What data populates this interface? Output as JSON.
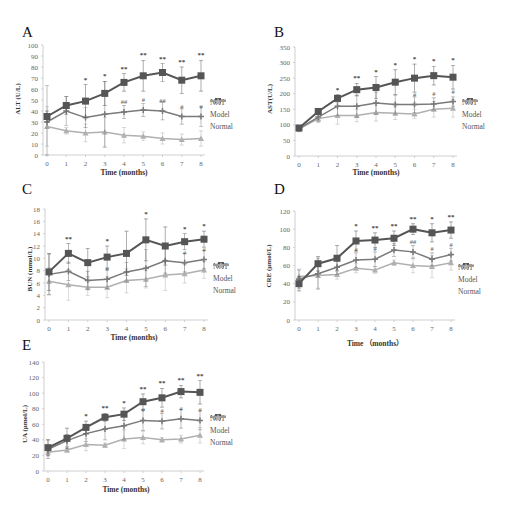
{
  "figure": {
    "legend": [
      "NXT",
      "Model",
      "Normal"
    ],
    "colors": {
      "NXT": "#7a7a7a",
      "Model": "#555555",
      "Normal": "#b0b0b0"
    }
  },
  "chart_data": [
    {
      "panel": "A",
      "type": "line",
      "title": "",
      "xlabel": "Time (months)",
      "ylabel": "ALT (U/L)",
      "x": [
        0,
        1,
        2,
        3,
        4,
        5,
        6,
        7,
        8
      ],
      "ylim": [
        0,
        100
      ],
      "yticks": [
        0,
        10,
        20,
        30,
        40,
        50,
        60,
        70,
        80,
        90,
        100
      ],
      "series": [
        {
          "name": "NXT",
          "values": [
            30,
            40,
            34,
            37,
            39,
            41,
            40,
            35,
            35
          ],
          "errors": [
            33,
            13,
            9,
            30,
            6,
            6,
            8,
            7,
            9
          ]
        },
        {
          "name": "Model",
          "values": [
            35,
            45,
            49,
            56,
            66,
            72,
            75,
            68,
            72
          ],
          "errors": [
            5,
            8,
            15,
            11,
            8,
            14,
            8,
            12,
            14
          ]
        },
        {
          "name": "Normal",
          "values": [
            26,
            22,
            20,
            21,
            18,
            17,
            15,
            14,
            15
          ],
          "errors": [
            18,
            3,
            8,
            13,
            7,
            4,
            5,
            5,
            7
          ]
        }
      ],
      "annotations_model": [
        "",
        "",
        "*",
        "*",
        "**",
        "**",
        "**",
        "**",
        "**"
      ],
      "annotations_nxt": [
        "",
        "",
        "",
        "",
        "##",
        "#",
        "##",
        "#",
        "#"
      ],
      "legend_position": "right"
    },
    {
      "panel": "B",
      "type": "line",
      "title": "",
      "xlabel": "Time (months)",
      "ylabel": "AST(U/L)",
      "x": [
        0,
        1,
        2,
        3,
        4,
        5,
        6,
        7,
        8
      ],
      "ylim": [
        0,
        350
      ],
      "yticks": [
        0,
        50,
        100,
        150,
        200,
        250,
        300,
        350
      ],
      "series": [
        {
          "name": "NXT",
          "values": [
            88,
            125,
            160,
            160,
            170,
            165,
            165,
            167,
            175
          ],
          "errors": [
            8,
            15,
            30,
            35,
            35,
            30,
            25,
            20,
            15
          ]
        },
        {
          "name": "Model",
          "values": [
            90,
            143,
            185,
            213,
            220,
            237,
            250,
            258,
            253
          ],
          "errors": [
            8,
            10,
            12,
            20,
            35,
            40,
            45,
            30,
            38
          ]
        },
        {
          "name": "Normal",
          "values": [
            86,
            120,
            130,
            130,
            140,
            137,
            135,
            150,
            153
          ],
          "errors": [
            8,
            12,
            28,
            20,
            28,
            20,
            15,
            25,
            28
          ]
        }
      ],
      "annotations_model": [
        "",
        "",
        "*",
        "**",
        "*",
        "*",
        "*",
        "*",
        "*"
      ],
      "annotations_nxt": [
        "",
        "",
        "",
        "",
        "",
        "",
        "#",
        "#",
        "#"
      ],
      "legend_position": "right"
    },
    {
      "panel": "C",
      "type": "line",
      "title": "",
      "xlabel": "Time (months)",
      "ylabel": "BUN (mmol/L)",
      "x": [
        0,
        1,
        2,
        3,
        4,
        5,
        6,
        7,
        8
      ],
      "ylim": [
        0,
        18
      ],
      "yticks": [
        0,
        2,
        4,
        6,
        8,
        10,
        12,
        14,
        16,
        18
      ],
      "series": [
        {
          "name": "NXT",
          "values": [
            7.4,
            7.9,
            6.4,
            6.6,
            7.8,
            8.4,
            9.6,
            9.3,
            9.8
          ],
          "errors": [
            3.3,
            1.5,
            1.5,
            1.5,
            1.5,
            3.0,
            2.0,
            1.5,
            1.5
          ]
        },
        {
          "name": "Model",
          "values": [
            7.8,
            10.8,
            9.3,
            10.2,
            10.8,
            13.0,
            12.0,
            12.7,
            13.1
          ],
          "errors": [
            3.0,
            1.6,
            2.3,
            1.8,
            3.6,
            3.4,
            3.1,
            1.3,
            1.3
          ]
        },
        {
          "name": "Normal",
          "values": [
            6.3,
            5.7,
            5.3,
            5.3,
            6.4,
            6.6,
            7.3,
            7.5,
            8.1
          ],
          "errors": [
            2.2,
            2.5,
            1.3,
            1.7,
            2.0,
            1.4,
            2.5,
            1.5,
            1.4
          ]
        }
      ],
      "annotations_model": [
        "",
        "**",
        "",
        "*",
        "",
        "*",
        "",
        "*",
        "*"
      ],
      "annotations_nxt": [
        "",
        "",
        "",
        "#",
        "",
        "",
        "",
        "#",
        "#"
      ],
      "legend_position": "right"
    },
    {
      "panel": "D",
      "type": "line",
      "title": "",
      "xlabel": "Time （months）",
      "ylabel": "CRE (μmol/L)",
      "x": [
        0,
        1,
        2,
        3,
        4,
        5,
        6,
        7,
        8
      ],
      "ylim": [
        0,
        120
      ],
      "yticks": [
        0,
        20,
        40,
        60,
        80,
        100,
        120
      ],
      "series": [
        {
          "name": "NXT",
          "values": [
            45,
            51,
            58,
            66,
            67,
            77,
            75,
            67,
            72
          ],
          "errors": [
            10,
            17,
            8,
            8,
            8,
            7,
            7,
            7,
            7
          ]
        },
        {
          "name": "Model",
          "values": [
            40,
            62,
            68,
            87,
            88,
            90,
            100,
            96,
            99
          ],
          "errors": [
            8,
            8,
            14,
            11,
            8,
            8,
            6,
            10,
            9
          ]
        },
        {
          "name": "Normal",
          "values": [
            48,
            49,
            50,
            57,
            55,
            63,
            60,
            59,
            63
          ],
          "errors": [
            8,
            14,
            5,
            5,
            4,
            3,
            8,
            12,
            8
          ]
        }
      ],
      "annotations_model": [
        "",
        "",
        "",
        "*",
        "**",
        "**",
        "**",
        "*",
        "**"
      ],
      "annotations_nxt": [
        "",
        "",
        "",
        "#",
        "#",
        "#",
        "##",
        "#",
        "#"
      ],
      "legend_position": "right"
    },
    {
      "panel": "E",
      "type": "line",
      "title": "",
      "xlabel": "Time (months)",
      "ylabel": "UA (μmol/L)",
      "x": [
        0,
        1,
        2,
        3,
        4,
        5,
        6,
        7,
        8
      ],
      "ylim": [
        0,
        140
      ],
      "yticks": [
        0,
        20,
        40,
        60,
        80,
        100,
        120,
        140
      ],
      "series": [
        {
          "name": "NXT",
          "values": [
            28,
            39,
            48,
            54,
            58,
            65,
            64,
            67,
            65
          ],
          "errors": [
            12,
            8,
            10,
            14,
            18,
            13,
            10,
            12,
            12
          ]
        },
        {
          "name": "Model",
          "values": [
            30,
            42,
            56,
            69,
            73,
            89,
            94,
            102,
            101
          ],
          "errors": [
            10,
            13,
            8,
            5,
            8,
            10,
            12,
            8,
            15
          ]
        },
        {
          "name": "Normal",
          "values": [
            24,
            27,
            34,
            33,
            41,
            43,
            40,
            41,
            46
          ],
          "errors": [
            5,
            3,
            8,
            3,
            12,
            8,
            3,
            5,
            10
          ]
        }
      ],
      "annotations_model": [
        "",
        "",
        "*",
        "**",
        "*",
        "**",
        "**",
        "**",
        "**"
      ],
      "annotations_nxt": [
        "",
        "",
        "",
        "",
        "",
        "#",
        "#",
        "#",
        "#"
      ],
      "legend_position": "right"
    }
  ],
  "panels": {
    "A": {
      "letter": "A",
      "ylabel": "ALT (U/L)",
      "xlabel": "Time (months)"
    },
    "B": {
      "letter": "B",
      "ylabel": "AST(U/L)",
      "xlabel": "Time (months)"
    },
    "C": {
      "letter": "C",
      "ylabel": "BUN (mmol/L)",
      "xlabel": "Time (months)"
    },
    "D": {
      "letter": "D",
      "ylabel": "CRE (μmol/L)",
      "xlabel": "Time （months）"
    },
    "E": {
      "letter": "E",
      "ylabel": "UA (μmol/L)",
      "xlabel": "Time (months)"
    }
  },
  "legend": [
    {
      "label": "NXT"
    },
    {
      "label": "Model"
    },
    {
      "label": "Normal"
    }
  ]
}
